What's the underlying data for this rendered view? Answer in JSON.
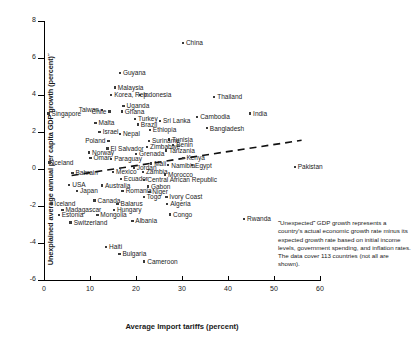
{
  "chart_data": {
    "type": "scatter",
    "title": "",
    "xlabel": "Average Import tariffs (percent)",
    "ylabel": "Unexplained average annual per capita GDP growth (percent)°",
    "xlim": [
      0,
      60
    ],
    "ylim": [
      -6,
      8
    ],
    "xticks": [
      0,
      10,
      20,
      30,
      40,
      50,
      60
    ],
    "yticks": [
      -6,
      -4,
      -2,
      0,
      2,
      4,
      6,
      8
    ],
    "grid": false,
    "legend": "none",
    "trendline": {
      "style": "dashed",
      "x0": 6.0,
      "y0": -0.35,
      "x1": 56.0,
      "y1": 1.55
    },
    "annotation": "˝Unexpected˝ GDP growth represents a country's actual economic growth rate minus its expected growth rate based on initial income levels, government spending, and inflation rates. The data cover 113 countries (not all are shown).",
    "points": [
      {
        "name": "China",
        "x": 30.2,
        "y": 6.8,
        "side": "r"
      },
      {
        "name": "Guyana",
        "x": 16.5,
        "y": 5.2,
        "side": "r"
      },
      {
        "name": "Malaysia",
        "x": 15.4,
        "y": 4.4,
        "side": "r"
      },
      {
        "name": "Korea, Rep.",
        "x": 14.6,
        "y": 4.0,
        "side": "r"
      },
      {
        "name": "Indonesia",
        "x": 20.9,
        "y": 4.0,
        "side": "r"
      },
      {
        "name": "Thailand",
        "x": 37.0,
        "y": 3.9,
        "side": "r"
      },
      {
        "name": "Uganda",
        "x": 17.3,
        "y": 3.4,
        "side": "r"
      },
      {
        "name": "Taiwan",
        "x": 12.6,
        "y": 3.2,
        "side": "l"
      },
      {
        "name": "Chile",
        "x": 14.2,
        "y": 3.1,
        "side": "l"
      },
      {
        "name": "Ghana",
        "x": 16.9,
        "y": 3.1,
        "side": "r"
      },
      {
        "name": "Singapore",
        "x": 1.0,
        "y": 3.0,
        "side": "r"
      },
      {
        "name": "India",
        "x": 44.8,
        "y": 3.0,
        "side": "r"
      },
      {
        "name": "Cambodia",
        "x": 33.3,
        "y": 2.8,
        "side": "r"
      },
      {
        "name": "Turkey",
        "x": 19.8,
        "y": 2.7,
        "side": "r"
      },
      {
        "name": "Sri Lanka",
        "x": 25.2,
        "y": 2.6,
        "side": "r"
      },
      {
        "name": "Malta",
        "x": 11.2,
        "y": 2.5,
        "side": "r"
      },
      {
        "name": "Brazil",
        "x": 20.4,
        "y": 2.4,
        "side": "r"
      },
      {
        "name": "Bangladesh",
        "x": 35.4,
        "y": 2.2,
        "side": "r"
      },
      {
        "name": "Ethiopia",
        "x": 23.0,
        "y": 2.1,
        "side": "r"
      },
      {
        "name": "Israel",
        "x": 12.1,
        "y": 2.0,
        "side": "r"
      },
      {
        "name": "Nepal",
        "x": 16.5,
        "y": 1.9,
        "side": "r"
      },
      {
        "name": "Tunisia",
        "x": 27.2,
        "y": 1.6,
        "side": "r"
      },
      {
        "name": "Poland",
        "x": 14.0,
        "y": 1.5,
        "side": "l"
      },
      {
        "name": "Suriname",
        "x": 22.8,
        "y": 1.5,
        "side": "r"
      },
      {
        "name": "Benin",
        "x": 28.1,
        "y": 1.3,
        "side": "r"
      },
      {
        "name": "Zimbabwe",
        "x": 22.4,
        "y": 1.2,
        "side": "r"
      },
      {
        "name": "El Salvador",
        "x": 13.8,
        "y": 1.1,
        "side": "r"
      },
      {
        "name": "Tanzania",
        "x": 26.5,
        "y": 1.0,
        "side": "r"
      },
      {
        "name": "Norway",
        "x": 9.8,
        "y": 0.9,
        "side": "r"
      },
      {
        "name": "Grenada",
        "x": 20.0,
        "y": 0.8,
        "side": "r"
      },
      {
        "name": "Oman",
        "x": 10.1,
        "y": 0.6,
        "side": "r"
      },
      {
        "name": "Paraguay",
        "x": 14.6,
        "y": 0.55,
        "side": "r"
      },
      {
        "name": "Kenya",
        "x": 30.3,
        "y": 0.6,
        "side": "r"
      },
      {
        "name": "Iceland",
        "x": 1.2,
        "y": 0.35,
        "side": "r"
      },
      {
        "name": "Mali",
        "x": 23.3,
        "y": 0.3,
        "side": "r"
      },
      {
        "name": "Namibia",
        "x": 27.0,
        "y": 0.2,
        "side": "r"
      },
      {
        "name": "Egypt",
        "x": 32.2,
        "y": 0.2,
        "side": "r"
      },
      {
        "name": "Jordan",
        "x": 19.5,
        "y": 0.05,
        "side": "r"
      },
      {
        "name": "Bahrain",
        "x": 6.2,
        "y": -0.2,
        "side": "r"
      },
      {
        "name": "Mexico",
        "x": 15.0,
        "y": -0.15,
        "side": "r"
      },
      {
        "name": "Zambia",
        "x": 21.5,
        "y": -0.15,
        "side": "r"
      },
      {
        "name": "Morocco",
        "x": 26.3,
        "y": -0.3,
        "side": "r"
      },
      {
        "name": "Ecuador",
        "x": 16.7,
        "y": -0.55,
        "side": "r"
      },
      {
        "name": "Central African Republic",
        "x": 21.8,
        "y": -0.6,
        "side": "r"
      },
      {
        "name": "USA",
        "x": 5.5,
        "y": -0.85,
        "side": "r"
      },
      {
        "name": "Australia",
        "x": 12.6,
        "y": -0.9,
        "side": "r"
      },
      {
        "name": "Gabon",
        "x": 22.6,
        "y": -0.95,
        "side": "r"
      },
      {
        "name": "Japan",
        "x": 7.2,
        "y": -1.2,
        "side": "r"
      },
      {
        "name": "Romania",
        "x": 17.1,
        "y": -1.2,
        "side": "r"
      },
      {
        "name": "Niger",
        "x": 22.9,
        "y": -1.25,
        "side": "r"
      },
      {
        "name": "Togo",
        "x": 21.7,
        "y": -1.5,
        "side": "r"
      },
      {
        "name": "Ivory Coast",
        "x": 26.6,
        "y": -1.5,
        "side": "r"
      },
      {
        "name": "Canada",
        "x": 11.0,
        "y": -1.7,
        "side": "r"
      },
      {
        "name": "Iceland ",
        "x": 1.6,
        "y": -1.9,
        "side": "r"
      },
      {
        "name": "Balarus",
        "x": 16.0,
        "y": -1.9,
        "side": "r"
      },
      {
        "name": "Algeria",
        "x": 26.8,
        "y": -1.9,
        "side": "r"
      },
      {
        "name": "Madagascar",
        "x": 4.0,
        "y": -2.2,
        "side": "r"
      },
      {
        "name": "Hungary",
        "x": 15.2,
        "y": -2.2,
        "side": "r"
      },
      {
        "name": "Estonia",
        "x": 3.2,
        "y": -2.5,
        "side": "r"
      },
      {
        "name": "Mongolia",
        "x": 11.6,
        "y": -2.5,
        "side": "r"
      },
      {
        "name": "Congo",
        "x": 27.4,
        "y": -2.45,
        "side": "r"
      },
      {
        "name": "Switzerland",
        "x": 5.8,
        "y": -2.9,
        "side": "r"
      },
      {
        "name": "Albania",
        "x": 19.2,
        "y": -2.8,
        "side": "r"
      },
      {
        "name": "Rwanda",
        "x": 43.5,
        "y": -2.7,
        "side": "r"
      },
      {
        "name": "Pakistan",
        "x": 54.5,
        "y": 0.1,
        "side": "r"
      },
      {
        "name": "Haiti",
        "x": 13.5,
        "y": -4.2,
        "side": "r"
      },
      {
        "name": "Bulgaria",
        "x": 16.4,
        "y": -4.6,
        "side": "r"
      },
      {
        "name": "Cameroon",
        "x": 21.8,
        "y": -5.0,
        "side": "r"
      }
    ]
  },
  "axis": {
    "x_ticks": [
      "0",
      "10",
      "20",
      "30",
      "40",
      "50",
      "60"
    ],
    "y_ticks": [
      "8",
      "6",
      "4",
      "2",
      "0",
      "-2",
      "-4",
      "-6"
    ],
    "x_title": "Average Import tariffs (percent)",
    "y_title": "Unexplained average annual per capita GDP growth (percent)˝"
  }
}
